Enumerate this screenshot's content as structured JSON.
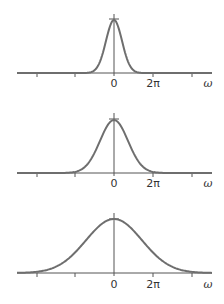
{
  "chart_data": [
    {
      "type": "line",
      "title": "",
      "description": "Gaussian, narrowest width",
      "xlabel": "ω",
      "ylabel": "",
      "tick_labels": [
        "0",
        "2π"
      ],
      "tick_positions_units_of_2pi": [
        -2,
        -1,
        0,
        1,
        2
      ],
      "xlim_units_of_2pi": [
        -2.5,
        2.5
      ],
      "sigma_units_of_2pi": 0.21,
      "peak": 1.0,
      "grid": false
    },
    {
      "type": "line",
      "title": "",
      "description": "Gaussian, medium width",
      "xlabel": "ω",
      "ylabel": "",
      "tick_labels": [
        "0",
        "2π"
      ],
      "tick_positions_units_of_2pi": [
        -2,
        -1,
        0,
        1,
        2
      ],
      "xlim_units_of_2pi": [
        -2.5,
        2.5
      ],
      "sigma_units_of_2pi": 0.36,
      "peak": 1.0,
      "grid": false
    },
    {
      "type": "line",
      "title": "",
      "description": "Gaussian, widest width",
      "xlabel": "ω",
      "ylabel": "",
      "tick_labels": [
        "0",
        "2π"
      ],
      "tick_positions_units_of_2pi": [
        -2,
        -1,
        0,
        1,
        2
      ],
      "xlim_units_of_2pi": [
        -2.5,
        2.5
      ],
      "sigma_units_of_2pi": 0.72,
      "peak": 1.0,
      "grid": false
    }
  ],
  "colors": {
    "curve": "#6e6e6e",
    "axis": "#555555"
  },
  "panels": [
    {
      "zero_label": "0",
      "twopi_label": "2π",
      "axis_label": "ω"
    },
    {
      "zero_label": "0",
      "twopi_label": "2π",
      "axis_label": "ω"
    },
    {
      "zero_label": "0",
      "twopi_label": "2π",
      "axis_label": "ω"
    }
  ]
}
